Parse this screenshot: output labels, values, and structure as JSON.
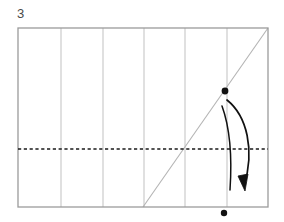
{
  "figure": {
    "step_label": "3",
    "type": "origami-fold-diagram",
    "canvas": {
      "width": 284,
      "height": 222,
      "background": "#ffffff"
    },
    "colors": {
      "paper_outline": "#9b9b9b",
      "crease_line": "#c2c2c2",
      "diagonal_crease": "#b0b0b0",
      "fold_line_dashed": "#1a1a1a",
      "arrow": "#111111",
      "dot": "#111111",
      "label_text": "#4a4a4a"
    },
    "paper_sheet": {
      "name": "paper-rectangle",
      "x": 18,
      "y": 28,
      "width": 250,
      "height": 179
    },
    "vertical_creases": {
      "name": "vertical-crease-lines",
      "count": 5,
      "x_positions": [
        61,
        103,
        144,
        185,
        227
      ],
      "y_top": 28,
      "y_bottom": 207
    },
    "horizontal_fold_line": {
      "name": "horizontal-dashed-fold-line",
      "y": 149,
      "x_start": 18,
      "x_end": 268,
      "style": "dashed"
    },
    "diagonal_crease": {
      "name": "diagonal-crease-line",
      "x1": 143,
      "y1": 207,
      "x2": 268,
      "y2": 28
    },
    "points": [
      {
        "name": "source-point",
        "x": 225,
        "y": 91,
        "radius": 3.4
      },
      {
        "name": "target-point",
        "x": 224,
        "y": 213,
        "radius": 3.2
      }
    ],
    "fold_arrow": {
      "name": "fold-direction-arrow",
      "start_x": 227,
      "start_y": 100,
      "end_x": 244,
      "end_y": 189,
      "direction": "down-right",
      "style": "double-stroke-curved-with-solid-arrowhead"
    }
  }
}
